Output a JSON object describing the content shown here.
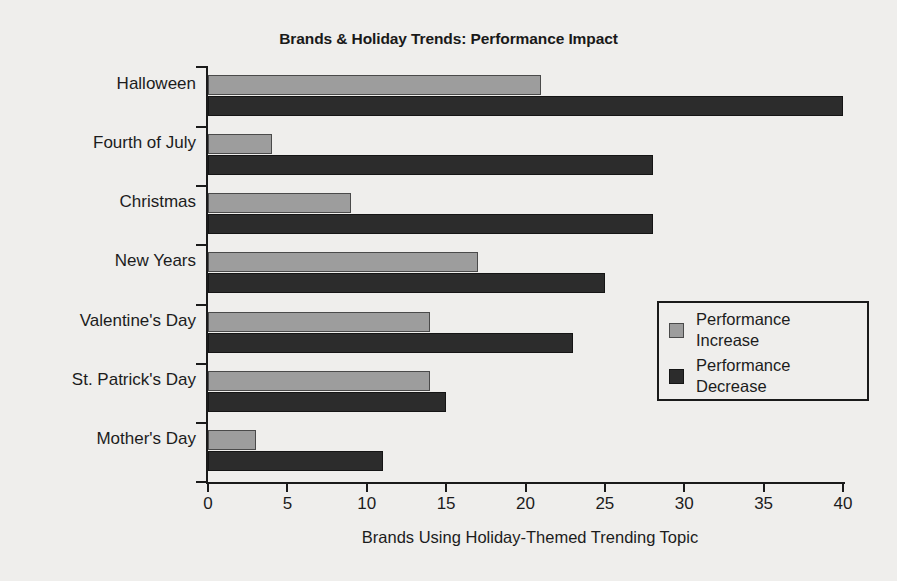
{
  "chart_data": {
    "type": "bar",
    "orientation": "horizontal",
    "title": "Brands & Holiday Trends: Performance Impact",
    "xlabel": "Brands Using Holiday-Themed Trending Topic",
    "ylabel": "",
    "xlim": [
      0,
      40
    ],
    "xticks": [
      0,
      5,
      10,
      15,
      20,
      25,
      30,
      35,
      40
    ],
    "grid": false,
    "legend_position": "center-right",
    "categories": [
      "Halloween",
      "Fourth of July",
      "Christmas",
      "New Years",
      "Valentine's Day",
      "St. Patrick's Day",
      "Mother's Day"
    ],
    "series": [
      {
        "name": "Performance Increase",
        "color": "#9d9d9d",
        "values": [
          21,
          4,
          9,
          17,
          14,
          14,
          3
        ]
      },
      {
        "name": "Performance Decrease",
        "color": "#2c2c2c",
        "values": [
          40,
          28,
          28,
          25,
          23,
          15,
          11
        ]
      }
    ]
  },
  "legend": {
    "items": [
      {
        "label_line1": "Performance",
        "label_line2": "Increase"
      },
      {
        "label_line1": "Performance",
        "label_line2": "Decrease"
      }
    ]
  },
  "colors": {
    "background": "#efeeec",
    "axis": "#1a1a1a",
    "text": "#1c1c1c",
    "increase": "#9d9d9d",
    "decrease": "#2c2c2c"
  }
}
